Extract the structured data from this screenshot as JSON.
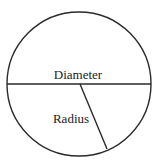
{
  "diagram": {
    "labels": {
      "diameter": "Diameter",
      "radius": "Radius"
    },
    "elements": [
      "circle",
      "diameter-line",
      "radius-line"
    ]
  }
}
